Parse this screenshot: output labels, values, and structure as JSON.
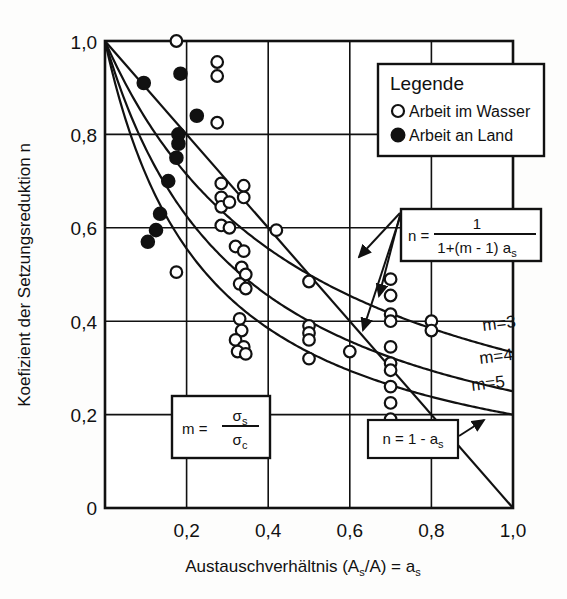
{
  "chart_data": {
    "type": "scatter",
    "title": "",
    "xlabel": "Austauschverhältnis (As/A) = as",
    "ylabel": "Koefizient der Setzungsreduktion n",
    "xlim": [
      0,
      1.0
    ],
    "ylim": [
      0,
      1.0
    ],
    "grid": true,
    "xticks": [
      "0",
      "0,2",
      "0,4",
      "0,6",
      "0,8",
      "1,0"
    ],
    "xtick_values": [
      0,
      0.2,
      0.4,
      0.6,
      0.8,
      1.0
    ],
    "yticks": [
      "0",
      "0,2",
      "0,4",
      "0,6",
      "0,8",
      "1,0"
    ],
    "ytick_values": [
      0,
      0.2,
      0.4,
      0.6,
      0.8,
      1.0
    ],
    "legend_position": "top-right",
    "series": [
      {
        "name": "Arbeit im Wasser",
        "marker": "open-circle",
        "points": [
          [
            0.175,
            1.0
          ],
          [
            0.275,
            0.955
          ],
          [
            0.275,
            0.925
          ],
          [
            0.275,
            0.825
          ],
          [
            0.175,
            0.505
          ],
          [
            0.285,
            0.695
          ],
          [
            0.285,
            0.665
          ],
          [
            0.285,
            0.645
          ],
          [
            0.305,
            0.655
          ],
          [
            0.34,
            0.69
          ],
          [
            0.34,
            0.665
          ],
          [
            0.285,
            0.605
          ],
          [
            0.305,
            0.6
          ],
          [
            0.32,
            0.56
          ],
          [
            0.34,
            0.55
          ],
          [
            0.335,
            0.515
          ],
          [
            0.345,
            0.5
          ],
          [
            0.33,
            0.48
          ],
          [
            0.345,
            0.47
          ],
          [
            0.42,
            0.595
          ],
          [
            0.33,
            0.405
          ],
          [
            0.335,
            0.38
          ],
          [
            0.32,
            0.36
          ],
          [
            0.34,
            0.345
          ],
          [
            0.325,
            0.335
          ],
          [
            0.345,
            0.33
          ],
          [
            0.5,
            0.485
          ],
          [
            0.5,
            0.39
          ],
          [
            0.5,
            0.375
          ],
          [
            0.5,
            0.36
          ],
          [
            0.5,
            0.32
          ],
          [
            0.6,
            0.335
          ],
          [
            0.7,
            0.49
          ],
          [
            0.7,
            0.455
          ],
          [
            0.7,
            0.415
          ],
          [
            0.7,
            0.4
          ],
          [
            0.7,
            0.345
          ],
          [
            0.7,
            0.31
          ],
          [
            0.7,
            0.295
          ],
          [
            0.7,
            0.26
          ],
          [
            0.7,
            0.225
          ],
          [
            0.7,
            0.19
          ],
          [
            0.8,
            0.4
          ],
          [
            0.8,
            0.38
          ]
        ]
      },
      {
        "name": "Arbeit an Land",
        "marker": "filled-circle",
        "points": [
          [
            0.095,
            0.91
          ],
          [
            0.185,
            0.93
          ],
          [
            0.225,
            0.84
          ],
          [
            0.18,
            0.8
          ],
          [
            0.18,
            0.78
          ],
          [
            0.175,
            0.75
          ],
          [
            0.155,
            0.7
          ],
          [
            0.135,
            0.63
          ],
          [
            0.125,
            0.595
          ],
          [
            0.105,
            0.57
          ]
        ]
      }
    ],
    "curves": [
      {
        "name": "m=3",
        "formula": "n = 1/(1+(m-1)*as)",
        "m": 3,
        "label": "m=3"
      },
      {
        "name": "m=4",
        "formula": "n = 1/(1+(m-1)*as)",
        "m": 4,
        "label": "m=4"
      },
      {
        "name": "m=5",
        "formula": "n = 1/(1+(m-1)*as)",
        "m": 5,
        "label": "m=5"
      },
      {
        "name": "linear",
        "formula": "n = 1 - as",
        "label": "n = 1 - as"
      }
    ]
  },
  "axes": {
    "x_title": "Austauschverhältnis (A",
    "x_title_sub1": "s",
    "x_title_mid": "/A) = a",
    "x_title_sub2": "s",
    "y_title": "Koefizient der Setzungsreduktion n"
  },
  "legend": {
    "title": "Legende",
    "items": [
      {
        "label": "Arbeit im Wasser",
        "marker": "open-circle"
      },
      {
        "label": "Arbeit an Land",
        "marker": "filled-circle"
      }
    ]
  },
  "annotations": {
    "formula_box": {
      "lhs": "n =",
      "numerator": "1",
      "denominator": "1+(m - 1) a",
      "denominator_sub": "s"
    },
    "m_box": {
      "lhs": "m =",
      "numerator": "σ",
      "numerator_sub": "s",
      "denominator": "σ",
      "denominator_sub": "c"
    },
    "line_box": {
      "text": "n = 1 - a",
      "sub": "s"
    },
    "curve_labels": [
      "m=3",
      "m=4",
      "m=5"
    ]
  },
  "colors": {
    "ink": "#111111",
    "background": "#fdfdfc",
    "grid": "#111111"
  }
}
